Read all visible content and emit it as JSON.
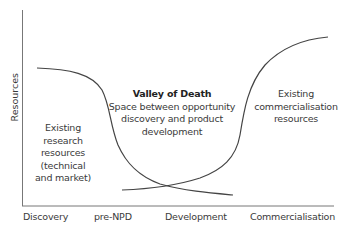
{
  "diagram": {
    "y_axis_label": "Resources",
    "x_axis_stages": [
      "Discovery",
      "pre-NPD",
      "Development",
      "Commercialisation"
    ],
    "annotations": {
      "valley_title": "Valley of Death",
      "valley_line1": "Space between opportunity",
      "valley_line2": "discovery and product",
      "valley_line3": "development",
      "research_line1": "Existing",
      "research_line2": "research",
      "research_line3": "resources",
      "research_line4": "(technical",
      "research_line5": "and market)",
      "commercial_line1": "Existing",
      "commercial_line2": "commercialisation",
      "commercial_line3": "resources"
    },
    "curves": [
      {
        "name": "research-resources",
        "trend": "decreasing"
      },
      {
        "name": "commercialisation-resources",
        "trend": "increasing"
      }
    ],
    "colors": {
      "axis": "#555555",
      "curve": "#444444",
      "text": "#3a3a3a"
    }
  }
}
